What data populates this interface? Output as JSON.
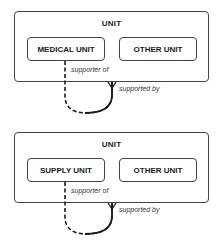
{
  "diagrams": [
    {
      "container": {
        "title": "UNIT"
      },
      "entities": [
        {
          "label": "MEDICAL UNIT"
        },
        {
          "label": "OTHER UNIT"
        }
      ],
      "relationship": {
        "from_label": "supporter of",
        "to_label": "supported by"
      }
    },
    {
      "container": {
        "title": "UNIT"
      },
      "entities": [
        {
          "label": "SUPPLY UNIT"
        },
        {
          "label": "OTHER UNIT"
        }
      ],
      "relationship": {
        "from_label": "supporter of",
        "to_label": "supported by"
      }
    }
  ],
  "colors": {
    "line": "#1a1a1a",
    "border": "#444444"
  }
}
